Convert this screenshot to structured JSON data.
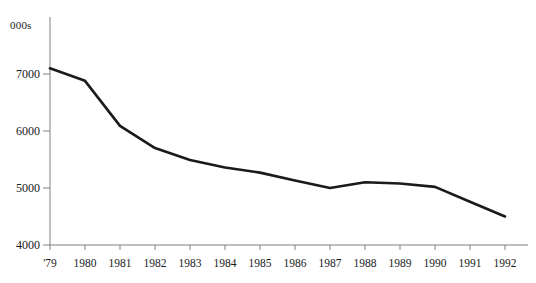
{
  "chart_data": {
    "type": "line",
    "title": "",
    "subtitle": "",
    "xlabel": "",
    "ylabel": "",
    "unit_label": "000s",
    "grid": false,
    "legend": false,
    "legend_position": "none",
    "line_color": "#1a1a1a",
    "background_color": "#ffffff",
    "axis_color": "#808080",
    "xlim_labels": [
      "'79",
      "1992"
    ],
    "ylim": [
      4000,
      7400
    ],
    "yticks": [
      4000,
      5000,
      6000,
      7000
    ],
    "ytick_labels": [
      "4000",
      "5000",
      "6000",
      "7000"
    ],
    "categories": [
      "'79",
      "1980",
      "1981",
      "1982",
      "1983",
      "1984",
      "1985",
      "1986",
      "1987",
      "1988",
      "1989",
      "1990",
      "1991",
      "1992"
    ],
    "x": [
      1979,
      1980,
      1981,
      1982,
      1983,
      1984,
      1985,
      1986,
      1987,
      1988,
      1989,
      1990,
      1991,
      1992
    ],
    "values": [
      7100,
      6880,
      6090,
      5700,
      5490,
      5360,
      5270,
      5130,
      5000,
      5100,
      5080,
      5020,
      4760,
      4500
    ],
    "series": [
      {
        "name": "",
        "values": [
          7100,
          6880,
          6090,
          5700,
          5490,
          5360,
          5270,
          5130,
          5000,
          5100,
          5080,
          5020,
          4760,
          4500
        ]
      }
    ]
  }
}
